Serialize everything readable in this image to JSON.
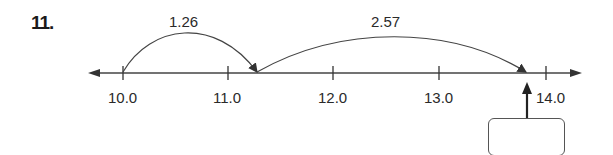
{
  "problem": {
    "number": "11."
  },
  "number_line": {
    "ticks": [
      {
        "value": 10.0,
        "label": "10.0",
        "x": 123
      },
      {
        "value": 11.0,
        "label": "11.0",
        "x": 228
      },
      {
        "value": 12.0,
        "label": "12.0",
        "x": 333
      },
      {
        "value": 13.0,
        "label": "13.0",
        "x": 439
      },
      {
        "value": 14.0,
        "label": "14.0",
        "x": 546
      }
    ],
    "jumps": [
      {
        "label": "1.26",
        "from": 10.0,
        "to": 11.26
      },
      {
        "label": "2.57",
        "from": 11.26,
        "to": 13.83
      }
    ],
    "answer_box": {
      "value": ""
    }
  },
  "colors": {
    "line": "#333333",
    "text": "#2a2a2a"
  }
}
